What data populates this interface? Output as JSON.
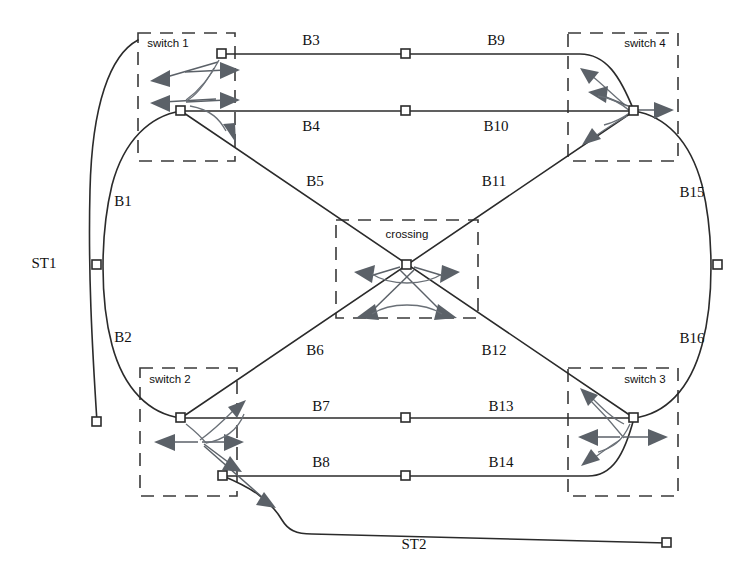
{
  "diagram": {
    "colors": {
      "track": "#2b2b2b",
      "region_box": "#3a3a3a",
      "route_arrow": "#5b6168",
      "background": "#ffffff"
    },
    "regions": [
      {
        "id": "switch1",
        "label": "switch 1",
        "x": 138,
        "y": 33,
        "w": 97,
        "h": 128,
        "label_x": 168,
        "label_y": 44
      },
      {
        "id": "switch4",
        "label": "switch 4",
        "x": 568,
        "y": 33,
        "w": 110,
        "h": 128,
        "label_x": 645,
        "label_y": 44
      },
      {
        "id": "crossing",
        "label": "crossing",
        "x": 336,
        "y": 220,
        "w": 142,
        "h": 98,
        "label_x": 407,
        "label_y": 235
      },
      {
        "id": "switch2",
        "label": "switch 2",
        "x": 140,
        "y": 368,
        "w": 97,
        "h": 128,
        "label_x": 170,
        "label_y": 380
      },
      {
        "id": "switch3",
        "label": "switch 3",
        "x": 568,
        "y": 368,
        "w": 110,
        "h": 128,
        "label_x": 645,
        "label_y": 380
      }
    ],
    "block_labels": [
      {
        "id": "B1",
        "text": "B1",
        "x": 123,
        "y": 203
      },
      {
        "id": "B2",
        "text": "B2",
        "x": 123,
        "y": 339
      },
      {
        "id": "B3",
        "text": "B3",
        "x": 311,
        "y": 42
      },
      {
        "id": "B4",
        "text": "B4",
        "x": 311,
        "y": 128
      },
      {
        "id": "B5",
        "text": "B5",
        "x": 315,
        "y": 183
      },
      {
        "id": "B6",
        "text": "B6",
        "x": 315,
        "y": 352
      },
      {
        "id": "B7",
        "text": "B7",
        "x": 321,
        "y": 408
      },
      {
        "id": "B8",
        "text": "B8",
        "x": 321,
        "y": 464
      },
      {
        "id": "B9",
        "text": "B9",
        "x": 496,
        "y": 42
      },
      {
        "id": "B10",
        "text": "B10",
        "x": 496,
        "y": 128
      },
      {
        "id": "B11",
        "text": "B11",
        "x": 494,
        "y": 183
      },
      {
        "id": "B12",
        "text": "B12",
        "x": 494,
        "y": 352
      },
      {
        "id": "B13",
        "text": "B13",
        "x": 501,
        "y": 408
      },
      {
        "id": "B14",
        "text": "B14",
        "x": 501,
        "y": 464
      },
      {
        "id": "B15",
        "text": "B15",
        "x": 692,
        "y": 194
      },
      {
        "id": "B16",
        "text": "B16",
        "x": 692,
        "y": 340
      },
      {
        "id": "ST1",
        "text": "ST1",
        "x": 44,
        "y": 265
      },
      {
        "id": "ST2",
        "text": "ST2",
        "x": 414,
        "y": 546
      }
    ],
    "nodes": [
      {
        "id": "n-sw1-top",
        "x": 222,
        "y": 54
      },
      {
        "id": "n-sw1-bottom",
        "x": 181,
        "y": 111
      },
      {
        "id": "n-b3-b9",
        "x": 406,
        "y": 54
      },
      {
        "id": "n-b4-b10",
        "x": 406,
        "y": 111
      },
      {
        "id": "n-sw4",
        "x": 634,
        "y": 111
      },
      {
        "id": "n-b1-b2",
        "x": 97,
        "y": 265
      },
      {
        "id": "n-b15-b16",
        "x": 718,
        "y": 265
      },
      {
        "id": "n-crossing",
        "x": 407,
        "y": 265
      },
      {
        "id": "n-sw2-top",
        "x": 181,
        "y": 418
      },
      {
        "id": "n-sw2-bottom",
        "x": 223,
        "y": 476
      },
      {
        "id": "n-b7-b13",
        "x": 406,
        "y": 418
      },
      {
        "id": "n-b8-b14",
        "x": 406,
        "y": 476
      },
      {
        "id": "n-sw3",
        "x": 634,
        "y": 418
      },
      {
        "id": "n-st1-end",
        "x": 97,
        "y": 422
      },
      {
        "id": "n-st2-end",
        "x": 667,
        "y": 543
      }
    ]
  }
}
